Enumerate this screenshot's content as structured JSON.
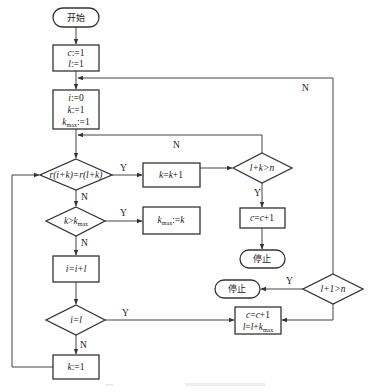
{
  "diagram": {
    "type": "flowchart",
    "nodes": {
      "start": {
        "shape": "terminal",
        "label": "开始"
      },
      "init1": {
        "shape": "process",
        "lines": [
          "c:=1",
          "l:=1"
        ]
      },
      "init2": {
        "shape": "process",
        "lines": [
          "i:=0",
          "k:=1",
          "kmax:=1"
        ]
      },
      "cmp": {
        "shape": "decision",
        "label": "r(i+k)=r(l+k)"
      },
      "inc_k": {
        "shape": "process",
        "label": "k=k+1"
      },
      "check_lk": {
        "shape": "decision",
        "label": "l+k>n"
      },
      "inc_c1": {
        "shape": "process",
        "label": "c=c+1"
      },
      "stop1": {
        "shape": "terminal",
        "label": "停止"
      },
      "check_kmax": {
        "shape": "decision",
        "label": "k>kmax"
      },
      "set_kmax": {
        "shape": "process",
        "label": "kmax:=k"
      },
      "inc_i": {
        "shape": "process",
        "label": "i=i+l"
      },
      "check_il": {
        "shape": "decision",
        "label": "i=l"
      },
      "reset_k": {
        "shape": "process",
        "label": "k:=1"
      },
      "check_l1": {
        "shape": "decision",
        "label": "l+1>n"
      },
      "stop2": {
        "shape": "terminal",
        "label": "停止"
      },
      "update": {
        "shape": "process",
        "lines": [
          "c=c+1",
          "l=l+kmax"
        ]
      }
    },
    "edge_labels": {
      "cmp_yes": "Y",
      "cmp_no": "N",
      "lk_yes": "Y",
      "lk_no": "N",
      "kmax_yes": "Y",
      "kmax_no": "N",
      "il_yes": "Y",
      "il_no": "N",
      "l1_yes": "Y",
      "l1_no": "N"
    },
    "edges": [
      [
        "start",
        "init1"
      ],
      [
        "init1",
        "init2"
      ],
      [
        "init2",
        "cmp"
      ],
      [
        "cmp",
        "inc_k",
        "Y"
      ],
      [
        "cmp",
        "check_kmax",
        "N"
      ],
      [
        "inc_k",
        "check_lk"
      ],
      [
        "check_lk",
        "cmp",
        "N"
      ],
      [
        "check_lk",
        "inc_c1",
        "Y"
      ],
      [
        "inc_c1",
        "stop1"
      ],
      [
        "check_kmax",
        "set_kmax",
        "Y"
      ],
      [
        "check_kmax",
        "inc_i",
        "N"
      ],
      [
        "inc_i",
        "check_il"
      ],
      [
        "check_il",
        "update",
        "Y"
      ],
      [
        "check_il",
        "reset_k",
        "N"
      ],
      [
        "reset_k",
        "cmp"
      ],
      [
        "check_l1",
        "stop2",
        "Y"
      ],
      [
        "check_l1",
        "init2",
        "N"
      ],
      [
        "check_l1",
        "update"
      ]
    ],
    "colors": {
      "stroke": "#333333",
      "background": "#ffffff",
      "text": "#222222"
    }
  }
}
